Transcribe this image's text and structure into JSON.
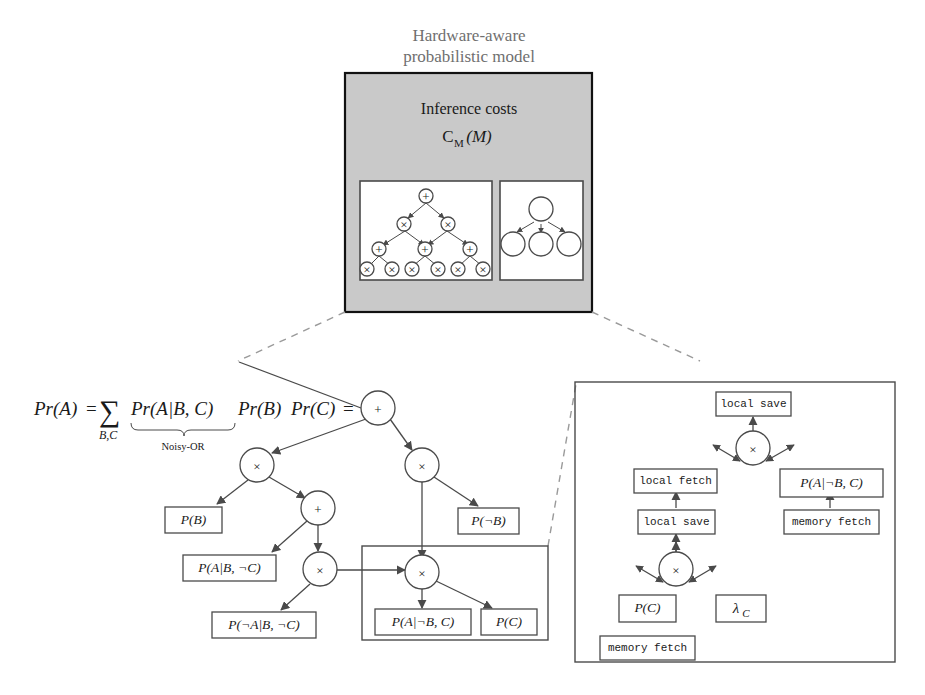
{
  "figure": {
    "header": {
      "line1": "Hardware-aware",
      "line2": "probabilistic model"
    },
    "gray_panel": {
      "title": "Inference costs",
      "cost_symbol": "C",
      "cost_sub": "M",
      "cost_arg": "(M)",
      "subpanels": [
        {
          "name": "arithmetic-circuit",
          "nodes": {
            "root": "+",
            "level2": [
              "×",
              "×"
            ],
            "level3": [
              "+",
              "+",
              "+"
            ],
            "leaves": [
              "×",
              "×",
              "×",
              "×",
              "×",
              "×"
            ]
          }
        },
        {
          "name": "bayesian-network",
          "nodes": [
            "",
            "",
            "",
            ""
          ]
        }
      ]
    },
    "equation": {
      "lhs": "Pr(A)",
      "eq1": "=",
      "sum": "∑",
      "sum_sub": "B,C",
      "term1": "Pr(A|B, C)",
      "term2": "Pr(B)",
      "term3": "Pr(C)",
      "eq2": "=",
      "brace_label": "Noisy-OR"
    },
    "circuit": {
      "nodes": [
        {
          "id": "root",
          "glyph": "+"
        },
        {
          "id": "mul-left",
          "glyph": "×"
        },
        {
          "id": "mul-right",
          "glyph": "×"
        },
        {
          "id": "plus-mid",
          "glyph": "+"
        },
        {
          "id": "mul-mid",
          "glyph": "×"
        },
        {
          "id": "mul-boxed",
          "glyph": "×"
        }
      ],
      "leaves": [
        {
          "id": "leaf-pb",
          "label": "P(B)"
        },
        {
          "id": "leaf-pab-notc",
          "label": "P(A|B, ¬C)"
        },
        {
          "id": "leaf-notpab-notc",
          "label": "P(¬A|B, ¬C)"
        },
        {
          "id": "leaf-pnotb",
          "label": "P(¬B)"
        },
        {
          "id": "leaf-pa-notb-c",
          "label": "P(A|¬B, C)"
        },
        {
          "id": "leaf-pc",
          "label": "P(C)"
        }
      ]
    },
    "detail_panel": {
      "nodes": [
        {
          "id": "detail-mul-top",
          "glyph": "×"
        },
        {
          "id": "detail-mul-bottom",
          "glyph": "×"
        }
      ],
      "boxes": [
        {
          "id": "local-save-top",
          "label": "local save",
          "kind": "op"
        },
        {
          "id": "local-fetch",
          "label": "local fetch",
          "kind": "op"
        },
        {
          "id": "local-save-mid",
          "label": "local save",
          "kind": "op"
        },
        {
          "id": "memory-fetch-right",
          "label": "memory fetch",
          "kind": "op"
        },
        {
          "id": "memory-fetch-bottom",
          "label": "memory fetch",
          "kind": "op"
        },
        {
          "id": "detail-pa-notb-c",
          "label": "P(A|¬B, C)",
          "kind": "prob"
        },
        {
          "id": "detail-pc",
          "label": "P(C)",
          "kind": "prob"
        },
        {
          "id": "detail-lambda-c",
          "label": "λ",
          "sub": "C",
          "kind": "prob"
        }
      ]
    },
    "colors": {
      "gray_fill": "#c9c9c9",
      "header_text": "#6f6f6f",
      "stroke": "#4a4a4a",
      "dashed": "#9a9a9a",
      "text": "#1a1a1a"
    }
  }
}
